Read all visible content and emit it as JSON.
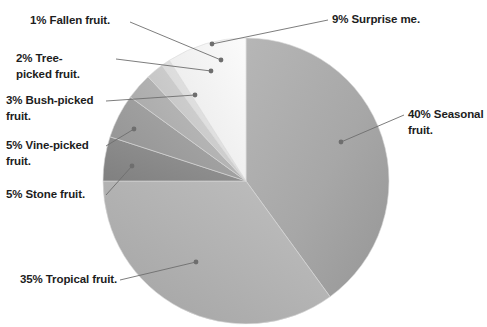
{
  "chart_data": {
    "type": "pie",
    "title": "",
    "xlabel": "",
    "ylabel": "",
    "legend_position": "none",
    "grid": false,
    "start_angle_deg": 0,
    "direction": "clockwise",
    "center": {
      "x": 246,
      "y": 181
    },
    "radius": 143,
    "categories": [
      "Seasonal fruit.",
      "Tropical fruit.",
      "Stone fruit.",
      "Vine-picked fruit.",
      "Bush-picked fruit.",
      "Tree-picked fruit.",
      "Fallen fruit.",
      "Surprise me."
    ],
    "values": [
      40,
      35,
      5,
      5,
      3,
      2,
      1,
      9
    ],
    "units": "percent",
    "slices": [
      {
        "label": "40% Seasonal fruit.",
        "name": "Seasonal fruit.",
        "value": 40,
        "color": "#a9a9a9",
        "start_deg": 0,
        "end_deg": 144,
        "leader_anchor": {
          "x": 341,
          "y": 142
        },
        "label_pos": {
          "x": 408,
          "y": 108
        }
      },
      {
        "label": "35% Tropical fruit.",
        "name": "Tropical fruit.",
        "value": 35,
        "color": "#b3b3b3",
        "start_deg": 144,
        "end_deg": 270,
        "leader_anchor": {
          "x": 196,
          "y": 262
        },
        "label_pos": {
          "x": 20,
          "y": 273
        }
      },
      {
        "label": "5% Stone fruit.",
        "name": "Stone fruit.",
        "value": 5,
        "color": "#8b8b8b",
        "start_deg": 270,
        "end_deg": 288,
        "leader_anchor": {
          "x": 132,
          "y": 166
        },
        "label_pos": {
          "x": 6,
          "y": 188
        }
      },
      {
        "label": "5% Vine-picked fruit.",
        "name": "Vine-picked fruit.",
        "value": 5,
        "color": "#9d9d9d",
        "start_deg": 288,
        "end_deg": 306,
        "leader_anchor": {
          "x": 134,
          "y": 129
        },
        "label_pos": {
          "x": 6,
          "y": 139
        }
      },
      {
        "label": "3% Bush-picked fruit.",
        "name": "Bush-picked fruit.",
        "value": 3,
        "color": "#b0b0b0",
        "start_deg": 306,
        "end_deg": 316.8,
        "leader_anchor": {
          "x": 195,
          "y": 95
        },
        "label_pos": {
          "x": 6,
          "y": 94
        }
      },
      {
        "label": "2% Tree-picked fruit.",
        "name": "Tree-picked fruit.",
        "value": 2,
        "color": "#c9c9c9",
        "start_deg": 316.8,
        "end_deg": 324,
        "leader_anchor": {
          "x": 211,
          "y": 71
        },
        "label_pos": {
          "x": 16,
          "y": 52
        }
      },
      {
        "label": "1% Fallen fruit.",
        "name": "Fallen fruit.",
        "value": 1,
        "color": "#dedede",
        "start_deg": 324,
        "end_deg": 327.6,
        "leader_anchor": {
          "x": 221,
          "y": 60
        },
        "label_pos": {
          "x": 30,
          "y": 15
        }
      },
      {
        "label": "9% Surprise me.",
        "name": "Surprise me.",
        "value": 9,
        "color": "#f1f1f1",
        "start_deg": 327.6,
        "end_deg": 360,
        "leader_anchor": {
          "x": 212,
          "y": 44
        },
        "label_pos": {
          "x": 332,
          "y": 13
        }
      }
    ]
  },
  "chart": {
    "leader_color": "#6e6e6e",
    "dot_color": "#6e6e6e",
    "background": "#ffffff",
    "slice_edge_color": "#d8d8d8",
    "title_fragment": ""
  },
  "labels": {
    "fallen": "1% Fallen fruit.",
    "surprise": "9% Surprise me.",
    "tree": "2% Tree-\npicked fruit.",
    "bush": "3% Bush-picked\nfruit.",
    "vine": "5% Vine-picked\nfruit.",
    "stone": "5% Stone fruit.",
    "tropical": "35% Tropical fruit.",
    "seasonal": "40% Seasonal\nfruit."
  }
}
